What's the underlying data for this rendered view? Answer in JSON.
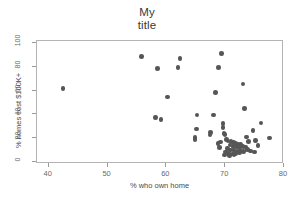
{
  "chart_data": {
    "type": "scatter",
    "title": "My\ntitle",
    "xlabel": "% who own home",
    "ylabel": "% homes cost $100K+",
    "xlim": [
      38,
      80
    ],
    "ylim": [
      -2,
      102
    ],
    "xticks": [
      40,
      50,
      60,
      70,
      80
    ],
    "yticks": [
      0,
      20,
      40,
      60,
      80,
      100
    ],
    "grid": false,
    "legend": null,
    "marker_color": "#565656",
    "marker_size": 4.6,
    "frame_color": "#b4b4b4",
    "points": [
      {
        "x": 42.4,
        "y": 62.0
      },
      {
        "x": 55.8,
        "y": 89.0
      },
      {
        "x": 58.5,
        "y": 78.5
      },
      {
        "x": 62.3,
        "y": 87.0
      },
      {
        "x": 62.0,
        "y": 79.5
      },
      {
        "x": 69.4,
        "y": 91.5
      },
      {
        "x": 68.9,
        "y": 79.5
      },
      {
        "x": 73.0,
        "y": 65.5
      },
      {
        "x": 68.4,
        "y": 58.5
      },
      {
        "x": 60.2,
        "y": 54.5
      },
      {
        "x": 73.3,
        "y": 45.0
      },
      {
        "x": 65.2,
        "y": 39.5
      },
      {
        "x": 68.0,
        "y": 39.5
      },
      {
        "x": 58.1,
        "y": 37.5
      },
      {
        "x": 59.1,
        "y": 35.5
      },
      {
        "x": 76.1,
        "y": 32.5
      },
      {
        "x": 69.6,
        "y": 32.0
      },
      {
        "x": 69.6,
        "y": 29.0
      },
      {
        "x": 65.1,
        "y": 27.5
      },
      {
        "x": 74.7,
        "y": 26.5
      },
      {
        "x": 67.5,
        "y": 24.5
      },
      {
        "x": 67.4,
        "y": 22.5
      },
      {
        "x": 69.8,
        "y": 24.0
      },
      {
        "x": 70.0,
        "y": 22.8
      },
      {
        "x": 77.5,
        "y": 20.0
      },
      {
        "x": 64.9,
        "y": 20.5
      },
      {
        "x": 64.9,
        "y": 18.5
      },
      {
        "x": 75.2,
        "y": 18.0
      },
      {
        "x": 69.0,
        "y": 12.0
      },
      {
        "x": 70.2,
        "y": 18.5
      },
      {
        "x": 70.5,
        "y": 17.5
      },
      {
        "x": 71.0,
        "y": 17.0
      },
      {
        "x": 71.4,
        "y": 16.0
      },
      {
        "x": 71.8,
        "y": 15.5
      },
      {
        "x": 72.2,
        "y": 15.0
      },
      {
        "x": 72.6,
        "y": 14.5
      },
      {
        "x": 70.8,
        "y": 14.0
      },
      {
        "x": 71.3,
        "y": 13.0
      },
      {
        "x": 71.9,
        "y": 12.5
      },
      {
        "x": 72.4,
        "y": 12.0
      },
      {
        "x": 73.0,
        "y": 13.0
      },
      {
        "x": 73.5,
        "y": 12.5
      },
      {
        "x": 70.4,
        "y": 11.0
      },
      {
        "x": 70.9,
        "y": 10.0
      },
      {
        "x": 71.5,
        "y": 9.5
      },
      {
        "x": 72.0,
        "y": 9.0
      },
      {
        "x": 72.6,
        "y": 9.0
      },
      {
        "x": 73.1,
        "y": 8.5
      },
      {
        "x": 70.1,
        "y": 8.0
      },
      {
        "x": 70.6,
        "y": 7.0
      },
      {
        "x": 71.2,
        "y": 6.5
      },
      {
        "x": 71.8,
        "y": 7.0
      },
      {
        "x": 72.4,
        "y": 7.5
      },
      {
        "x": 69.9,
        "y": 5.5
      },
      {
        "x": 70.7,
        "y": 5.0
      },
      {
        "x": 71.5,
        "y": 5.5
      },
      {
        "x": 73.8,
        "y": 10.5
      },
      {
        "x": 74.3,
        "y": 9.0
      },
      {
        "x": 75.0,
        "y": 8.0
      },
      {
        "x": 74.0,
        "y": 17.0
      },
      {
        "x": 73.6,
        "y": 21.0
      },
      {
        "x": 75.6,
        "y": 13.5
      },
      {
        "x": 68.8,
        "y": 15.5
      },
      {
        "x": 69.2,
        "y": 16.5
      }
    ]
  }
}
